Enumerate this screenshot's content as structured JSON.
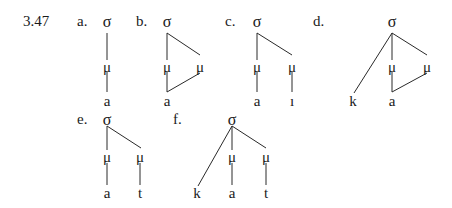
{
  "example_number": "3.47",
  "line_color": "#2a2a2a",
  "diagrams": [
    {
      "id": "a",
      "label": "a.",
      "label_pos": [
        77,
        14
      ],
      "nodes": [
        {
          "text": "σ",
          "x": 107,
          "y": 14,
          "type": "sigma"
        },
        {
          "text": "μ",
          "x": 107,
          "y": 60,
          "type": "mora"
        },
        {
          "text": "a",
          "x": 107,
          "y": 94,
          "type": "segment"
        }
      ],
      "edges": [
        [
          107,
          33,
          107,
          60
        ],
        [
          107,
          72,
          107,
          92
        ]
      ]
    },
    {
      "id": "b",
      "label": "b.",
      "label_pos": [
        136,
        14
      ],
      "nodes": [
        {
          "text": "σ",
          "x": 167,
          "y": 14,
          "type": "sigma"
        },
        {
          "text": "μ",
          "x": 167,
          "y": 60,
          "type": "mora"
        },
        {
          "text": "μ",
          "x": 200,
          "y": 60,
          "type": "mora"
        },
        {
          "text": "a",
          "x": 167,
          "y": 94,
          "type": "segment"
        }
      ],
      "edges": [
        [
          167,
          33,
          167,
          60
        ],
        [
          167,
          33,
          200,
          55
        ],
        [
          167,
          72,
          167,
          92
        ],
        [
          167,
          92,
          200,
          73
        ]
      ]
    },
    {
      "id": "c",
      "label": "c.",
      "label_pos": [
        225,
        14
      ],
      "nodes": [
        {
          "text": "σ",
          "x": 257,
          "y": 14,
          "type": "sigma"
        },
        {
          "text": "μ",
          "x": 257,
          "y": 60,
          "type": "mora"
        },
        {
          "text": "μ",
          "x": 292,
          "y": 60,
          "type": "mora"
        },
        {
          "text": "a",
          "x": 257,
          "y": 94,
          "type": "segment"
        },
        {
          "text": "ı",
          "x": 292,
          "y": 94,
          "type": "segment"
        }
      ],
      "edges": [
        [
          257,
          33,
          257,
          60
        ],
        [
          257,
          33,
          292,
          55
        ],
        [
          257,
          72,
          257,
          92
        ],
        [
          292,
          72,
          292,
          92
        ]
      ]
    },
    {
      "id": "d",
      "label": "d.",
      "label_pos": [
        313,
        14
      ],
      "nodes": [
        {
          "text": "σ",
          "x": 392,
          "y": 14,
          "type": "sigma"
        },
        {
          "text": "μ",
          "x": 392,
          "y": 60,
          "type": "mora"
        },
        {
          "text": "μ",
          "x": 427,
          "y": 60,
          "type": "mora"
        },
        {
          "text": "k",
          "x": 353,
          "y": 94,
          "type": "segment"
        },
        {
          "text": "a",
          "x": 392,
          "y": 94,
          "type": "segment"
        }
      ],
      "edges": [
        [
          392,
          33,
          354,
          93
        ],
        [
          392,
          33,
          392,
          60
        ],
        [
          392,
          33,
          427,
          55
        ],
        [
          392,
          72,
          392,
          92
        ],
        [
          392,
          92,
          427,
          73
        ]
      ]
    },
    {
      "id": "e",
      "label": "e.",
      "label_pos": [
        77,
        112
      ],
      "nodes": [
        {
          "text": "σ",
          "x": 107,
          "y": 112,
          "type": "sigma"
        },
        {
          "text": "μ",
          "x": 107,
          "y": 150,
          "type": "mora"
        },
        {
          "text": "μ",
          "x": 140,
          "y": 150,
          "type": "mora"
        },
        {
          "text": "a",
          "x": 107,
          "y": 186,
          "type": "segment"
        },
        {
          "text": "t",
          "x": 140,
          "y": 186,
          "type": "segment"
        }
      ],
      "edges": [
        [
          107,
          126,
          107,
          150
        ],
        [
          107,
          126,
          141,
          148
        ],
        [
          107,
          163,
          107,
          185
        ],
        [
          140,
          163,
          140,
          185
        ]
      ]
    },
    {
      "id": "f",
      "label": "f.",
      "label_pos": [
        173,
        112
      ],
      "nodes": [
        {
          "text": "σ",
          "x": 232,
          "y": 112,
          "type": "sigma"
        },
        {
          "text": "μ",
          "x": 232,
          "y": 150,
          "type": "mora"
        },
        {
          "text": "μ",
          "x": 266,
          "y": 150,
          "type": "mora"
        },
        {
          "text": "k",
          "x": 197,
          "y": 186,
          "type": "segment"
        },
        {
          "text": "a",
          "x": 232,
          "y": 186,
          "type": "segment"
        },
        {
          "text": "t",
          "x": 266,
          "y": 186,
          "type": "segment"
        }
      ],
      "edges": [
        [
          232,
          126,
          198,
          186
        ],
        [
          232,
          126,
          232,
          150
        ],
        [
          232,
          126,
          266,
          148
        ],
        [
          232,
          163,
          232,
          185
        ],
        [
          266,
          163,
          266,
          185
        ]
      ]
    }
  ]
}
